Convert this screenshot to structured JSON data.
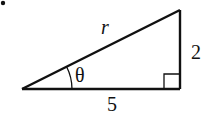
{
  "diagram": {
    "type": "right-triangle",
    "labels": {
      "hypotenuse": "r",
      "opposite": "2",
      "adjacent": "5",
      "angle": "θ"
    },
    "bullet": "•",
    "colors": {
      "stroke": "#111111",
      "background": "#ffffff"
    }
  }
}
